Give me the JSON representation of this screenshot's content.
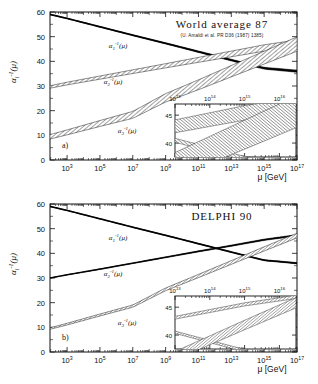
{
  "figure": {
    "axis_label_x": "μ [GeV]",
    "y_axis_label": "α",
    "y_axis_label_sub": "i",
    "y_axis_label_sup": "-1",
    "y_axis_label_arg": "(μ)"
  },
  "panels": [
    {
      "tag": "a)",
      "title": "World average 87",
      "citation": "(U. Amaldi et al. PR D36 (1987) 1385)",
      "band_style": "wide-hatched",
      "curve_labels": [
        {
          "base": "α",
          "sub": "1",
          "sup": "-1",
          "arg": "(μ)"
        },
        {
          "base": "α",
          "sub": "2",
          "sup": "-1",
          "arg": "(μ)"
        },
        {
          "base": "α",
          "sub": "3",
          "sup": "-1",
          "arg": "(μ)"
        }
      ],
      "x_tick_labels": [
        "10^3",
        "10^5",
        "10^7",
        "10^9",
        "10^11",
        "10^13",
        "10^15",
        "10^17"
      ],
      "y_tick_labels": [
        "0",
        "10",
        "20",
        "30",
        "40",
        "50",
        "60"
      ],
      "inset": {
        "x_tick_labels": [
          "10^13",
          "10^14",
          "10^15",
          "10^16"
        ],
        "y_tick_labels": [
          "40",
          "45"
        ]
      }
    },
    {
      "tag": "b)",
      "title": "DELPHI 90",
      "citation": "",
      "band_style": "narrow",
      "curve_labels": [
        {
          "base": "α",
          "sub": "1",
          "sup": "-1",
          "arg": "(μ)"
        },
        {
          "base": "α",
          "sub": "2",
          "sup": "-1",
          "arg": "(μ)"
        },
        {
          "base": "α",
          "sub": "3",
          "sup": "-1",
          "arg": "(μ)"
        }
      ],
      "x_tick_labels": [
        "10^3",
        "10^5",
        "10^7",
        "10^9",
        "10^11",
        "10^13",
        "10^15",
        "10^17"
      ],
      "y_tick_labels": [
        "0",
        "10",
        "20",
        "30",
        "40",
        "50",
        "60"
      ],
      "inset": {
        "x_tick_labels": [
          "10^13",
          "10^14",
          "10^15",
          "10^16"
        ],
        "y_tick_labels": [
          "40",
          "45"
        ]
      }
    }
  ],
  "chart_data": [
    {
      "type": "line",
      "title": "World average 87",
      "subtitle": "(U. Amaldi et al. PR D36 (1987) 1385)",
      "panel_tag": "a)",
      "xlabel": "μ [GeV]",
      "ylabel": "α_i^-1(μ)",
      "xscale": "log",
      "xlim": [
        91.2,
        1e+17
      ],
      "ylim": [
        0,
        60
      ],
      "yticks": [
        0,
        10,
        20,
        30,
        40,
        50,
        60
      ],
      "xticks": [
        1000,
        100000,
        10000000,
        1000000000,
        100000000000.0,
        10000000000000.0,
        1000000000000000.0,
        1e+17
      ],
      "grid": false,
      "legend": "inline-curve-labels",
      "series": [
        {
          "name": "α_1^-1(μ)",
          "x": [
            91.2,
            1000.0,
            100000.0,
            10000000.0,
            1000000000.0,
            100000000000.0,
            10000000000000.0,
            1000000000000000.0,
            1e+17
          ],
          "values": [
            59.0,
            57.4,
            54.0,
            50.6,
            47.3,
            43.9,
            40.5,
            37.2,
            36.0
          ],
          "band_halfwidth": [
            0.15,
            0.15,
            0.2,
            0.22,
            0.25,
            0.3,
            0.35,
            0.4,
            0.45
          ]
        },
        {
          "name": "α_2^-1(μ)",
          "x": [
            91.2,
            1000.0,
            100000.0,
            10000000.0,
            1000000000.0,
            100000000000.0,
            10000000000000.0,
            1000000000000000.0,
            1e+17
          ],
          "values": [
            29.6,
            31.0,
            33.4,
            35.8,
            38.2,
            40.6,
            43.0,
            45.4,
            47.2
          ],
          "band_halfwidth": [
            0.5,
            0.55,
            0.65,
            0.75,
            0.85,
            1.0,
            1.15,
            1.3,
            1.45
          ]
        },
        {
          "name": "α_3^-1(μ)",
          "x": [
            91.2,
            1000.0,
            100000.0,
            10000000.0,
            1000000000.0,
            100000000000.0,
            10000000000000.0,
            1000000000000000.0,
            1e+17
          ],
          "values": [
            9.4,
            11.2,
            14.8,
            18.3,
            25.2,
            30.5,
            36.0,
            41.5,
            47.0
          ],
          "band_halfwidth": [
            0.9,
            1.0,
            1.2,
            1.4,
            1.7,
            2.0,
            2.3,
            2.6,
            2.9
          ]
        }
      ],
      "inset": {
        "xlim": [
          10000000000000.0,
          3e+16
        ],
        "ylim": [
          37.5,
          47.0
        ],
        "xticks": [
          10000000000000.0,
          100000000000000.0,
          1000000000000000.0,
          1e+16
        ],
        "yticks": [
          40,
          45
        ],
        "note": "magnified unification region; bands do not meet at a single point"
      }
    },
    {
      "type": "line",
      "title": "DELPHI 90",
      "subtitle": "",
      "panel_tag": "b)",
      "xlabel": "μ [GeV]",
      "ylabel": "α_i^-1(μ)",
      "xscale": "log",
      "xlim": [
        91.2,
        1e+17
      ],
      "ylim": [
        0,
        60
      ],
      "yticks": [
        0,
        10,
        20,
        30,
        40,
        50,
        60
      ],
      "xticks": [
        1000,
        100000,
        10000000,
        1000000000,
        100000000000.0,
        10000000000000.0,
        1000000000000000.0,
        1e+17
      ],
      "grid": false,
      "legend": "inline-curve-labels",
      "series": [
        {
          "name": "α_1^-1(μ)",
          "x": [
            91.2,
            1000.0,
            100000.0,
            10000000.0,
            1000000000.0,
            100000000000.0,
            10000000000000.0,
            1000000000000000.0,
            1e+17
          ],
          "values": [
            59.0,
            57.4,
            54.0,
            50.6,
            47.3,
            43.9,
            40.5,
            37.2,
            36.0
          ],
          "band_halfwidth": [
            0.1,
            0.1,
            0.12,
            0.14,
            0.16,
            0.18,
            0.2,
            0.22,
            0.25
          ]
        },
        {
          "name": "α_2^-1(μ)",
          "x": [
            91.2,
            1000.0,
            100000.0,
            10000000.0,
            1000000000.0,
            100000000000.0,
            10000000000000.0,
            1000000000000000.0,
            1e+17
          ],
          "values": [
            30.0,
            31.3,
            33.6,
            36.0,
            38.4,
            40.8,
            43.1,
            45.5,
            47.3
          ],
          "band_halfwidth": [
            0.12,
            0.14,
            0.16,
            0.18,
            0.2,
            0.22,
            0.25,
            0.28,
            0.3
          ]
        },
        {
          "name": "α_3^-1(μ)",
          "x": [
            91.2,
            1000.0,
            100000.0,
            10000000.0,
            1000000000.0,
            100000000000.0,
            10000000000000.0,
            1000000000000000.0,
            1e+17
          ],
          "values": [
            9.5,
            11.3,
            15.0,
            18.6,
            25.4,
            30.8,
            36.3,
            41.8,
            47.2
          ],
          "band_halfwidth": [
            0.3,
            0.35,
            0.4,
            0.45,
            0.55,
            0.65,
            0.75,
            0.85,
            0.95
          ]
        }
      ],
      "inset": {
        "xlim": [
          10000000000000.0,
          3e+16
        ],
        "ylim": [
          37.5,
          47.0
        ],
        "xticks": [
          10000000000000.0,
          100000000000000.0,
          1000000000000000.0,
          1e+16
        ],
        "yticks": [
          40,
          45
        ],
        "note": "magnified unification region; narrow bands"
      }
    }
  ]
}
